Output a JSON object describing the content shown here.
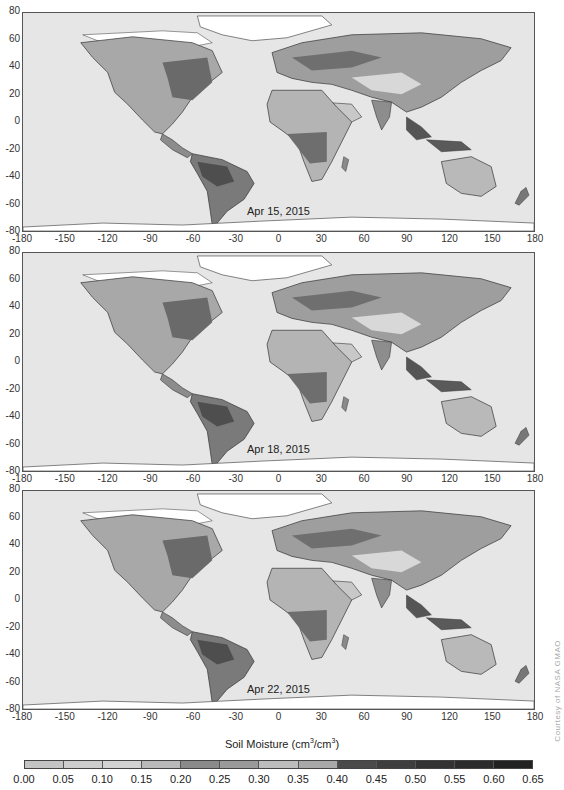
{
  "figure": {
    "colorbar_title": "Soil Moisture (cm",
    "colorbar_unit_sup1": "3",
    "colorbar_unit_mid": "/cm",
    "colorbar_unit_sup2": "3",
    "colorbar_unit_end": ")",
    "colorbar_ticks": [
      "0.00",
      "0.05",
      "0.10",
      "0.15",
      "0.20",
      "0.25",
      "0.30",
      "0.35",
      "0.40",
      "0.45",
      "0.50",
      "0.55",
      "0.60",
      "0.65"
    ],
    "colorbar_colors": [
      "#c4c4c4",
      "#cdcdcd",
      "#d2d2d2",
      "#b9b9b9",
      "#8a8a8a",
      "#9a9a9a",
      "#bdbdbd",
      "#a9a9a9",
      "#4a4a4a",
      "#3e3e3e",
      "#333333",
      "#2c2c2c",
      "#222222"
    ],
    "credit": "Courtesy of NASA GMAO"
  },
  "axes": {
    "y_ticks": [
      "80",
      "60",
      "40",
      "20",
      "0",
      "-20",
      "-40",
      "-60",
      "-80"
    ],
    "x_ticks": [
      "-180",
      "-150",
      "-120",
      "-90",
      "-60",
      "-30",
      "0",
      "30",
      "60",
      "90",
      "120",
      "150",
      "180"
    ]
  },
  "panels": [
    {
      "date": "Apr 15, 2015"
    },
    {
      "date": "Apr 18, 2015"
    },
    {
      "date": "Apr 22, 2015"
    }
  ],
  "colors": {
    "ocean": "#e6e6e6",
    "ice": "#ffffff",
    "land_dry": "#bfbfbf",
    "land_mid": "#9a9a9a",
    "land_wet": "#5a5a5a",
    "coast": "#333333"
  }
}
